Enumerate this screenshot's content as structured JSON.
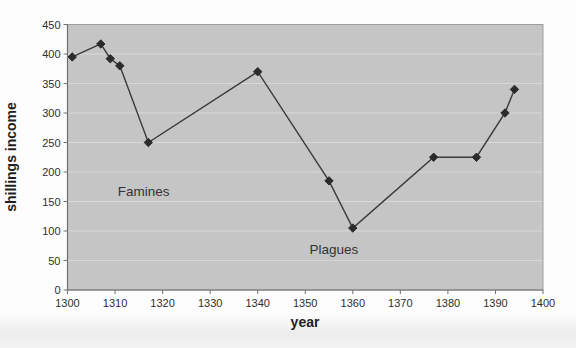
{
  "chart_data": {
    "type": "line",
    "title": "",
    "xlabel": "year",
    "ylabel": "shillings income",
    "xlim": [
      1300,
      1400
    ],
    "ylim": [
      0,
      450
    ],
    "x_ticks": [
      1300,
      1310,
      1320,
      1330,
      1340,
      1350,
      1360,
      1370,
      1380,
      1390,
      1400
    ],
    "y_ticks": [
      0,
      50,
      100,
      150,
      200,
      250,
      300,
      350,
      400,
      450
    ],
    "grid": true,
    "legend": "none",
    "series": [
      {
        "name": "shillings income",
        "marker": "diamond",
        "points": [
          [
            1301,
            395
          ],
          [
            1307,
            417
          ],
          [
            1309,
            392
          ],
          [
            1311,
            380
          ],
          [
            1317,
            250
          ],
          [
            1340,
            370
          ],
          [
            1355,
            185
          ],
          [
            1360,
            105
          ],
          [
            1377,
            225
          ],
          [
            1386,
            225
          ],
          [
            1392,
            300
          ],
          [
            1394,
            340
          ]
        ]
      }
    ],
    "annotations": [
      {
        "text": "Famines",
        "x": 1316,
        "y": 168
      },
      {
        "text": "Plagues",
        "x": 1356,
        "y": 70
      }
    ],
    "colors": {
      "page_bg": "#fdfdfd",
      "plot_bg": "#c5c5c5",
      "gridline": "#d8d8d8",
      "plot_border": "#9e9e9e",
      "axis_line": "#707070",
      "series_line": "#3a3a3a",
      "marker_fill": "#2b2b2b",
      "text": "#2e2e2e"
    }
  }
}
